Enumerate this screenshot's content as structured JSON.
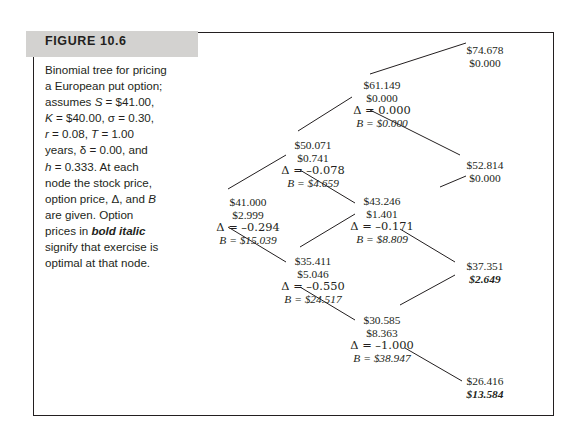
{
  "figure": {
    "label": "FIGURE 10.6",
    "caption_lines": [
      "Binomial tree for pricing",
      "a European put option;",
      "assumes S = $41.00,",
      "K = $40.00, σ = 0.30,",
      "r = 0.08, T = 1.00",
      "years, δ = 0.00, and",
      "h = 0.333. At each",
      "node the stock price,",
      "option price, Δ, and B",
      "are given. Option",
      "prices in bold italic",
      "signify that exercise is",
      "optimal at that node."
    ],
    "caption_emphasis": "bold italic"
  },
  "chart_data": {
    "type": "diagram",
    "parameters": {
      "S": "$41.00",
      "K": "$40.00",
      "sigma": "0.30",
      "r": "0.08",
      "T": "1.00",
      "delta": "0.00",
      "h": "0.333"
    },
    "nodes": [
      {
        "id": "root",
        "stock_price": "$41.000",
        "option_price": "$2.999",
        "delta": "Δ = –0.294",
        "bond": "B = $15.039",
        "exercise_optimal": false,
        "x": 248,
        "y": 196
      },
      {
        "id": "up1",
        "stock_price": "$50.071",
        "option_price": "$0.741",
        "delta": "Δ = –0.078",
        "bond": "B = $4.659",
        "exercise_optimal": false,
        "x": 313,
        "y": 139
      },
      {
        "id": "down1",
        "stock_price": "$35.411",
        "option_price": "$5.046",
        "delta": "Δ = –0.550",
        "bond": "B = $24.517",
        "exercise_optimal": false,
        "x": 313,
        "y": 255
      },
      {
        "id": "up2",
        "stock_price": "$61.149",
        "option_price": "$0.000",
        "delta": "Δ = 0.000",
        "bond": "B = $0.000",
        "exercise_optimal": false,
        "x": 382,
        "y": 79
      },
      {
        "id": "mid2",
        "stock_price": "$43.246",
        "option_price": "$1.401",
        "delta": "Δ = –0.171",
        "bond": "B = $8.809",
        "exercise_optimal": false,
        "x": 382,
        "y": 195
      },
      {
        "id": "down2",
        "stock_price": "$30.585",
        "option_price": "$8.363",
        "delta": "Δ = –1.000",
        "bond": "B = $38.947",
        "exercise_optimal": false,
        "x": 382,
        "y": 314
      },
      {
        "id": "uuu",
        "stock_price": "$74.678",
        "option_price": "$0.000",
        "delta": "",
        "bond": "",
        "exercise_optimal": false,
        "x": 485,
        "y": 44
      },
      {
        "id": "uud",
        "stock_price": "$52.814",
        "option_price": "$0.000",
        "delta": "",
        "bond": "",
        "exercise_optimal": false,
        "x": 485,
        "y": 159
      },
      {
        "id": "udd",
        "stock_price": "$37.351",
        "option_price": "$2.649",
        "delta": "",
        "bond": "",
        "exercise_optimal": true,
        "x": 485,
        "y": 260
      },
      {
        "id": "ddd",
        "stock_price": "$26.416",
        "option_price": "$13.584",
        "delta": "",
        "bond": "",
        "exercise_optimal": true,
        "x": 485,
        "y": 375
      }
    ],
    "edges": [
      {
        "from": "root",
        "to": "up1"
      },
      {
        "from": "root",
        "to": "down1"
      },
      {
        "from": "up1",
        "to": "up2"
      },
      {
        "from": "up1",
        "to": "mid2"
      },
      {
        "from": "down1",
        "to": "mid2"
      },
      {
        "from": "down1",
        "to": "down2"
      },
      {
        "from": "up2",
        "to": "uuu"
      },
      {
        "from": "up2",
        "to": "uud"
      },
      {
        "from": "mid2",
        "to": "uud"
      },
      {
        "from": "mid2",
        "to": "udd"
      },
      {
        "from": "down2",
        "to": "udd"
      },
      {
        "from": "down2",
        "to": "ddd"
      }
    ]
  }
}
